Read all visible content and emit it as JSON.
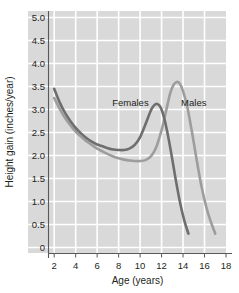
{
  "chart_data": {
    "type": "line",
    "title": "",
    "xlabel": "Age (years)",
    "ylabel": "Height gain (inches/year)",
    "xlim": [
      1,
      18
    ],
    "ylim": [
      0,
      5
    ],
    "xticks": [
      "2",
      "4",
      "6",
      "8",
      "10",
      "12",
      "14",
      "16",
      "18"
    ],
    "xtick_values": [
      2,
      4,
      6,
      8,
      10,
      12,
      14,
      16,
      18
    ],
    "yticks": [
      "0",
      "0.5",
      "1.0",
      "1.5",
      "2.0",
      "2.5",
      "3.0",
      "3.5",
      "4.0",
      "4.5",
      "5.0"
    ],
    "ytick_values": [
      0,
      0.5,
      1.0,
      1.5,
      2.0,
      2.5,
      3.0,
      3.5,
      4.0,
      4.5,
      5.0
    ],
    "grid": true,
    "legend_position": "inline-annotation",
    "plot_background": "#d9d9d9",
    "gridline_color": "#ffffff",
    "series": [
      {
        "name": "Females",
        "color": "#6e6e6e",
        "annotation": "Females",
        "annotation_x": 9.1,
        "annotation_y": 3.07,
        "x": [
          2.0,
          2.5,
          3.0,
          3.5,
          4.0,
          4.5,
          5.0,
          5.5,
          6.0,
          6.5,
          7.0,
          7.5,
          8.0,
          8.5,
          9.0,
          9.5,
          10.0,
          10.5,
          11.0,
          11.3,
          11.6,
          11.9,
          12.2,
          12.5,
          12.9,
          13.3,
          13.7,
          14.1,
          14.5
        ],
        "y": [
          3.45,
          3.16,
          2.93,
          2.75,
          2.6,
          2.48,
          2.38,
          2.3,
          2.24,
          2.2,
          2.16,
          2.13,
          2.12,
          2.12,
          2.15,
          2.23,
          2.4,
          2.68,
          2.98,
          3.09,
          3.12,
          3.05,
          2.85,
          2.55,
          2.05,
          1.5,
          1.0,
          0.6,
          0.3
        ]
      },
      {
        "name": "Males",
        "color": "#9d9d9d",
        "annotation": "Males",
        "annotation_x": 15.0,
        "annotation_y": 3.07,
        "x": [
          2.0,
          2.5,
          3.0,
          3.5,
          4.0,
          4.5,
          5.0,
          5.5,
          6.0,
          6.5,
          7.0,
          7.5,
          8.0,
          8.5,
          9.0,
          9.5,
          10.0,
          10.5,
          11.0,
          11.5,
          12.0,
          12.4,
          12.8,
          13.1,
          13.4,
          13.7,
          14.0,
          14.4,
          14.8,
          15.2,
          15.7,
          16.2,
          16.6,
          17.0
        ],
        "y": [
          3.25,
          3.02,
          2.82,
          2.66,
          2.52,
          2.41,
          2.31,
          2.23,
          2.15,
          2.09,
          2.03,
          1.98,
          1.94,
          1.91,
          1.89,
          1.88,
          1.88,
          1.9,
          1.98,
          2.18,
          2.55,
          2.95,
          3.35,
          3.53,
          3.6,
          3.56,
          3.4,
          3.05,
          2.55,
          2.0,
          1.35,
          0.85,
          0.55,
          0.3
        ]
      }
    ]
  },
  "axes": {
    "y_title": "Height gain (inches/year)",
    "x_title": "Age (years)"
  }
}
